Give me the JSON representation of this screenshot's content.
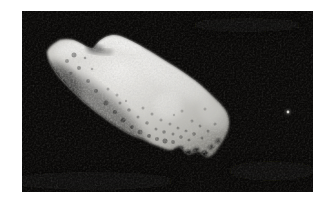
{
  "scene": {
    "description": "Grayscale space photograph of a large irregular elongated cratered asteroid, tilted diagonally, with a tiny moon appearing as a small bright dot to its right against black space",
    "objects": {
      "asteroid": "irregular cratered asteroid",
      "moon": "small moon dot"
    }
  },
  "colors": {
    "page_background": "#ffffff",
    "space_black": "#0a0908",
    "asteroid_bright": "#efeeec",
    "asteroid_light": "#d2d1cd",
    "asteroid_mid": "#b2b1ac",
    "asteroid_dark": "#6b6a65",
    "moon_core": "#d6d5d0",
    "moon_halo": "#8b8a85"
  },
  "asteroid": {
    "craters": [
      [
        52,
        44,
        2.5,
        0.35
      ],
      [
        45,
        50,
        2,
        0.3
      ],
      [
        57,
        57,
        2,
        0.35
      ],
      [
        49,
        62,
        1.5,
        0.3
      ],
      [
        66,
        70,
        2,
        0.3
      ],
      [
        74,
        80,
        2,
        0.35
      ],
      [
        84,
        92,
        2.5,
        0.35
      ],
      [
        93,
        101,
        2,
        0.4
      ],
      [
        101,
        109,
        2.5,
        0.4
      ],
      [
        110,
        116,
        2,
        0.4
      ],
      [
        118,
        121,
        2.5,
        0.35
      ],
      [
        127,
        125,
        2,
        0.4
      ],
      [
        135,
        128,
        2,
        0.35
      ],
      [
        143,
        130,
        2.5,
        0.4
      ],
      [
        151,
        131,
        2,
        0.35
      ],
      [
        98,
        92,
        1.5,
        0.3
      ],
      [
        107,
        99,
        1.8,
        0.3
      ],
      [
        116,
        106,
        1.5,
        0.3
      ],
      [
        125,
        112,
        1.8,
        0.3
      ],
      [
        134,
        118,
        1.5,
        0.3
      ],
      [
        142,
        121,
        1.8,
        0.35
      ],
      [
        151,
        123,
        1.5,
        0.3
      ],
      [
        159,
        126,
        1.8,
        0.35
      ],
      [
        167,
        129,
        1.5,
        0.3
      ],
      [
        121,
        97,
        1.5,
        0.25
      ],
      [
        130,
        103,
        1.5,
        0.25
      ],
      [
        139,
        109,
        1.5,
        0.25
      ],
      [
        148,
        113,
        1.5,
        0.25
      ],
      [
        156,
        117,
        1.5,
        0.3
      ],
      [
        164,
        120,
        1.5,
        0.3
      ],
      [
        172,
        123,
        1.8,
        0.35
      ],
      [
        180,
        127,
        1.5,
        0.3
      ],
      [
        86,
        78,
        1.5,
        0.25
      ],
      [
        95,
        84,
        1.5,
        0.25
      ],
      [
        104,
        90,
        1.2,
        0.25
      ],
      [
        170,
        110,
        1.5,
        0.25
      ],
      [
        178,
        115,
        1.5,
        0.3
      ],
      [
        186,
        120,
        1.5,
        0.3
      ],
      [
        193,
        113,
        1.5,
        0.25
      ],
      [
        183,
        98,
        1.5,
        0.2
      ],
      [
        160,
        100,
        1.5,
        0.2
      ],
      [
        152,
        104,
        1.2,
        0.2
      ],
      [
        63,
        47,
        1.3,
        0.3
      ],
      [
        70,
        58,
        1.3,
        0.25
      ]
    ],
    "claw_shadows": [
      [
        158,
        138,
        4,
        2.5,
        0.7
      ],
      [
        166,
        142,
        4,
        3,
        0.8
      ],
      [
        174,
        139,
        3.5,
        2.5,
        0.7
      ],
      [
        182,
        143,
        4,
        3,
        0.8
      ],
      [
        189,
        136,
        3,
        2,
        0.6
      ],
      [
        196,
        130,
        3,
        2.5,
        0.5
      ]
    ],
    "moon": {
      "x": 266,
      "y": 101,
      "core_r": 1.4,
      "halo_r": 3
    }
  }
}
